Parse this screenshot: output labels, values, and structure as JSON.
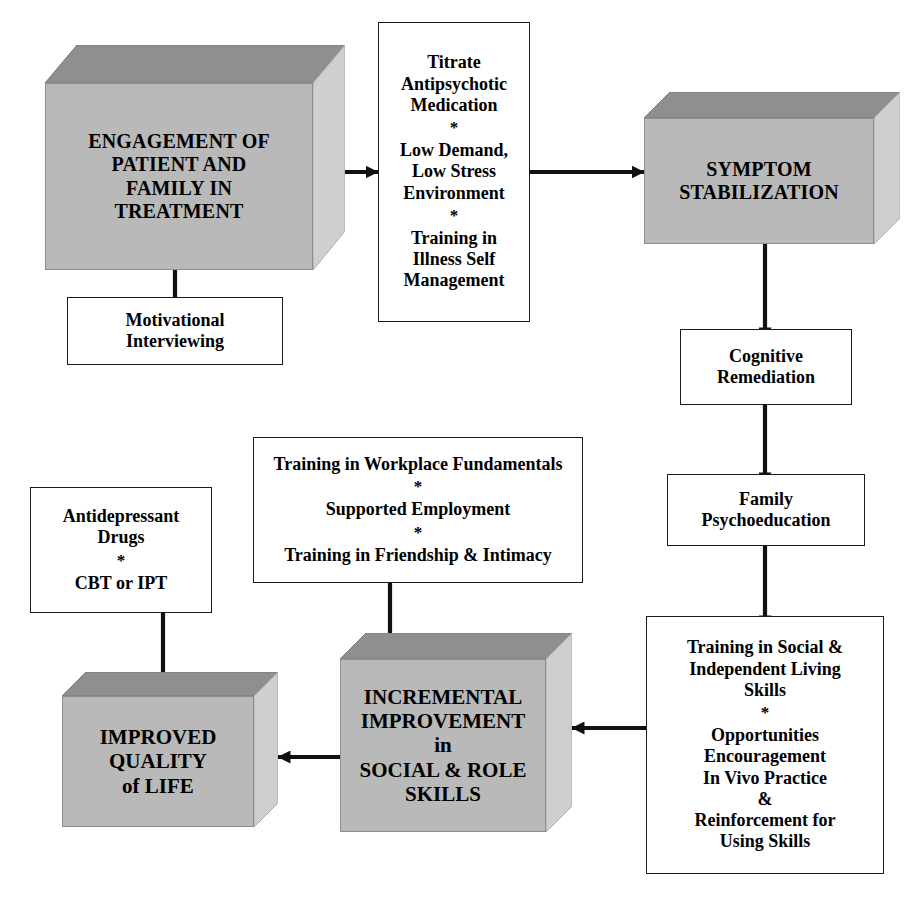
{
  "diagram": {
    "colors": {
      "box_fill_3d_front": "#b9b9b9",
      "box_fill_3d_top": "#8f8f8f",
      "box_fill_3d_side": "#cfcfcf",
      "box_fill_flat": "#ffffff",
      "stroke": "#1a1a1a",
      "text": "#000000"
    },
    "nodes": [
      {
        "id": "engagement",
        "name": "engagement-of-patient-and-family-in-treatment",
        "style": "box3d",
        "lines": [
          "ENGAGEMENT OF",
          "PATIENT AND",
          "FAMILY IN",
          "TREATMENT"
        ]
      },
      {
        "id": "motivational",
        "name": "motivational-interviewing",
        "style": "flat",
        "lines": [
          "Motivational",
          "Interviewing"
        ]
      },
      {
        "id": "titrate",
        "name": "titrate-medication-and-environment",
        "style": "flat",
        "groups": [
          [
            "Titrate",
            "Antipsychotic",
            "Medication"
          ],
          [
            "Low Demand,",
            "Low Stress",
            "Environment"
          ],
          [
            "Training in",
            "Illness Self",
            "Management"
          ]
        ],
        "separator": "*"
      },
      {
        "id": "symptom",
        "name": "symptom-stabilization",
        "style": "box3d",
        "lines": [
          "SYMPTOM",
          "STABILIZATION"
        ]
      },
      {
        "id": "cognitive",
        "name": "cognitive-remediation",
        "style": "flat",
        "lines": [
          "Cognitive",
          "Remediation"
        ]
      },
      {
        "id": "family",
        "name": "family-psychoeducation",
        "style": "flat",
        "lines": [
          "Family",
          "Psychoeducation"
        ]
      },
      {
        "id": "socialskills",
        "name": "training-in-social-and-independent-living-skills",
        "style": "flat",
        "groups": [
          [
            "Training in Social &",
            "Independent Living",
            "Skills"
          ],
          [
            "Opportunities",
            "Encouragement",
            "In Vivo Practice",
            "&",
            "Reinforcement for",
            "Using Skills"
          ]
        ],
        "separator": "*"
      },
      {
        "id": "workplace",
        "name": "training-in-workplace-fundamentals",
        "style": "flat",
        "groups": [
          [
            "Training in Workplace Fundamentals"
          ],
          [
            "Supported Employment"
          ],
          [
            "Training in Friendship & Intimacy"
          ]
        ],
        "separator": "*"
      },
      {
        "id": "antidepressant",
        "name": "antidepressant-drugs",
        "style": "flat",
        "groups": [
          [
            "Antidepressant",
            "Drugs"
          ],
          [
            "CBT or IPT"
          ]
        ],
        "separator": "*"
      },
      {
        "id": "incremental",
        "name": "incremental-improvement-in-social-and-role-skills",
        "style": "box3d",
        "lines": [
          "INCREMENTAL",
          "IMPROVEMENT",
          "in",
          "SOCIAL & ROLE",
          "SKILLS"
        ]
      },
      {
        "id": "quality",
        "name": "improved-quality-of-life",
        "style": "box3d",
        "lines": [
          "IMPROVED",
          "QUALITY",
          "of LIFE"
        ]
      }
    ],
    "edges": [
      {
        "from": "motivational",
        "to": "engagement",
        "direction": "up"
      },
      {
        "from": "engagement",
        "to": "titrate",
        "direction": "right"
      },
      {
        "from": "titrate",
        "to": "symptom",
        "direction": "right"
      },
      {
        "from": "symptom",
        "to": "cognitive",
        "direction": "down"
      },
      {
        "from": "cognitive",
        "to": "family",
        "direction": "down"
      },
      {
        "from": "family",
        "to": "socialskills",
        "direction": "down"
      },
      {
        "from": "socialskills",
        "to": "incremental",
        "direction": "left"
      },
      {
        "from": "workplace",
        "to": "incremental",
        "direction": "down"
      },
      {
        "from": "incremental",
        "to": "quality",
        "direction": "left"
      },
      {
        "from": "antidepressant",
        "to": "quality",
        "direction": "down"
      }
    ]
  }
}
